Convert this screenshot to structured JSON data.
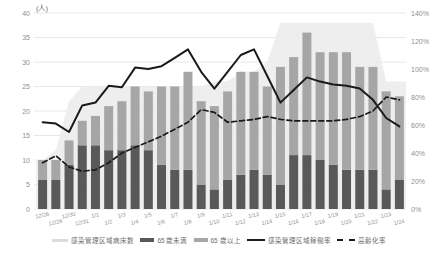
{
  "unit_label": "(人)",
  "chart_data": {
    "type": "combo-stacked-bar-area-line",
    "title": "",
    "unit_label": "(人)",
    "categories": [
      "12/28",
      "12/29",
      "12/30",
      "12/31",
      "1/1",
      "1/2",
      "1/3",
      "1/4",
      "1/5",
      "1/6",
      "1/7",
      "1/8",
      "1/9",
      "1/10",
      "1/11",
      "1/12",
      "1/13",
      "1/14",
      "1/15",
      "1/16",
      "1/17",
      "1/18",
      "1/19",
      "1/20",
      "1/21",
      "1/22",
      "1/23",
      "1/24"
    ],
    "series": [
      {
        "name": "感染管理区域病床数",
        "type": "area",
        "axis": "left",
        "color": "#ececec",
        "values": [
          10,
          12,
          22,
          25,
          25,
          25,
          25,
          25,
          25,
          25,
          25,
          25,
          25,
          26,
          26,
          28,
          28,
          30,
          38,
          38,
          38,
          38,
          38,
          38,
          38,
          38,
          26,
          26
        ]
      },
      {
        "name": "65 歳未満",
        "type": "bar",
        "stack": "people",
        "axis": "left",
        "color": "#595959",
        "values": [
          6,
          6,
          9,
          13,
          13,
          12,
          12,
          13,
          12,
          9,
          8,
          8,
          5,
          4,
          6,
          7,
          8,
          7,
          5,
          11,
          11,
          10,
          9,
          8,
          8,
          8,
          4,
          6
        ]
      },
      {
        "name": "65 歳以上",
        "type": "bar",
        "stack": "people",
        "axis": "left",
        "color": "#a6a6a6",
        "values": [
          4,
          4,
          5,
          5,
          6,
          9,
          10,
          12,
          12,
          16,
          17,
          20,
          17,
          17,
          18,
          21,
          20,
          18,
          24,
          20,
          25,
          22,
          23,
          24,
          21,
          21,
          20,
          17
        ]
      },
      {
        "name": "感染管理区域稼働率",
        "type": "line",
        "style": "solid",
        "axis": "right",
        "color": "#1a1a1a",
        "values": [
          62,
          61,
          55,
          74,
          76,
          88,
          87,
          101,
          100,
          102,
          108,
          114,
          98,
          86,
          98,
          110,
          114,
          95,
          76,
          85,
          94,
          91,
          89,
          88,
          86,
          78,
          65,
          59
        ]
      },
      {
        "name": "高齢化率",
        "type": "line",
        "style": "dashed",
        "axis": "right",
        "color": "#1a1a1a",
        "values": [
          33,
          38,
          30,
          27,
          28,
          33,
          40,
          44,
          48,
          52,
          57,
          62,
          71,
          69,
          62,
          63,
          64,
          66,
          64,
          63,
          63,
          63,
          63,
          64,
          66,
          70,
          80,
          78
        ]
      }
    ],
    "left_axis": {
      "min": 0,
      "max": 40,
      "step": 5,
      "ticks": [
        "0",
        "5",
        "10",
        "15",
        "20",
        "25",
        "30",
        "35",
        "40"
      ]
    },
    "right_axis": {
      "min": 0,
      "max": 140,
      "step": 20,
      "ticks": [
        "0%",
        "20%",
        "40%",
        "60%",
        "80%",
        "100%",
        "120%",
        "140%"
      ]
    },
    "grid": true,
    "legend_position": "bottom",
    "colors": {
      "grid": "#e8e8e8",
      "axis_text": "#8f8f8f",
      "bar_under65": "#595959",
      "bar_over65": "#a6a6a6",
      "area_beds": "#ececec",
      "line": "#1a1a1a",
      "background": "#ffffff"
    }
  }
}
